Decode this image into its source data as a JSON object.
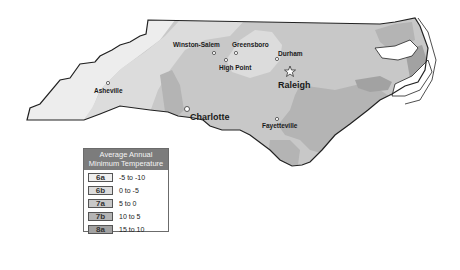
{
  "map": {
    "state": "North Carolina",
    "colors": {
      "zone_6a": "#efefef",
      "zone_6b": "#dcdcdc",
      "zone_7a": "#c8c8c8",
      "zone_7b": "#b4b4b4",
      "zone_8a": "#a2a2a2",
      "outline": "#222222",
      "water": "#ffffff"
    },
    "cities": [
      {
        "name": "Winston-Salem",
        "x": 214,
        "y": 53
      },
      {
        "name": "Greensboro",
        "x": 236,
        "y": 53
      },
      {
        "name": "High Point",
        "x": 226,
        "y": 60
      },
      {
        "name": "Durham",
        "x": 277,
        "y": 59
      },
      {
        "name": "Raleigh",
        "x": 290,
        "y": 71,
        "capital": true
      },
      {
        "name": "Asheville",
        "x": 108,
        "y": 83
      },
      {
        "name": "Charlotte",
        "x": 187,
        "y": 109
      },
      {
        "name": "Fayetteville",
        "x": 277,
        "y": 119
      }
    ]
  },
  "legend": {
    "title_line1": "Average Annual",
    "title_line2": "Minimum Temperature",
    "items": [
      {
        "zone": "6a",
        "range": "-5 to -10",
        "color": "#efefef"
      },
      {
        "zone": "6b",
        "range": "0 to -5",
        "color": "#dcdcdc"
      },
      {
        "zone": "7a",
        "range": "5 to 0",
        "color": "#c8c8c8"
      },
      {
        "zone": "7b",
        "range": "10 to 5",
        "color": "#b4b4b4"
      },
      {
        "zone": "8a",
        "range": "15 to 10",
        "color": "#a2a2a2"
      }
    ]
  }
}
